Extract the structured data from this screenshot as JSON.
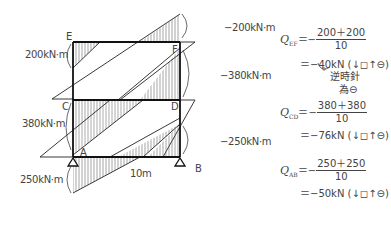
{
  "diagram": {
    "nodes": {
      "E": "E",
      "F": "F",
      "C": "C",
      "D": "D",
      "A": "A",
      "B": "B"
    },
    "moments": {
      "left_EF": "200kN·m",
      "right_EF": "−200kN·m",
      "left_CD": "380kN·m",
      "right_CD": "−380kN·m",
      "left_AB": "250kN·m",
      "right_AB": "−250kN·m"
    },
    "span": "10m",
    "colors": {
      "line": "#222222",
      "hatch": "#555555"
    }
  },
  "equations": [
    {
      "q": "Q",
      "sub": "EF",
      "numerator": "200＋200",
      "denominator": "10",
      "result": "＝−40kN (↓◻↑⊖)",
      "eq_sign": "＝−"
    },
    {
      "q": "Q",
      "sub": "CD",
      "numerator": "380＋380",
      "denominator": "10",
      "result": "＝−76kN (↓◻↑⊖)",
      "eq_sign": "＝−"
    },
    {
      "q": "Q",
      "sub": "AB",
      "numerator": "250＋250",
      "denominator": "10",
      "result": "＝−50kN (↓◻↑⊖)",
      "eq_sign": "＝−"
    }
  ],
  "note": {
    "line1": "逆時針",
    "line2": "為⊖"
  }
}
